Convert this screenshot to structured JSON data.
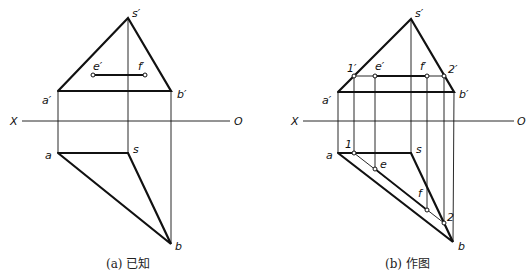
{
  "panels": [
    {
      "caption": "(a) 已知",
      "axis": {
        "left": "X",
        "right": "O"
      },
      "labels": {
        "s_prime": "s′",
        "a_prime": "a′",
        "b_prime": "b′",
        "e_prime": "e′",
        "f_prime": "f′",
        "a": "a",
        "s": "s",
        "b": "b"
      }
    },
    {
      "caption": "(b) 作图",
      "axis": {
        "left": "X",
        "right": "O"
      },
      "labels": {
        "s_prime": "s′",
        "a_prime": "a′",
        "b_prime": "b′",
        "one_prime": "1′",
        "e_prime": "e′",
        "f_prime": "f′",
        "two_prime": "2′",
        "a": "a",
        "s": "s",
        "b": "b",
        "one": "1",
        "e": "e",
        "f": "f",
        "two": "2"
      }
    }
  ]
}
